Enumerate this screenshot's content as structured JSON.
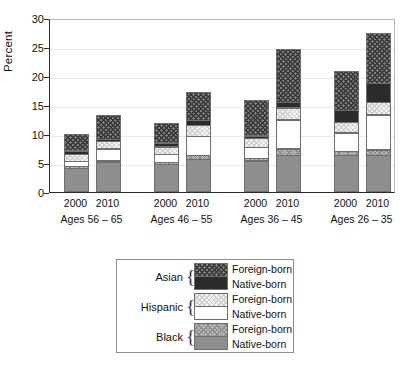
{
  "chart_data": {
    "type": "bar",
    "subtype": "stacked-bar-grouped",
    "title": "",
    "xlabel": "",
    "ylabel": "Percent",
    "ylim": [
      0,
      30
    ],
    "yticks": [
      0,
      5,
      10,
      15,
      20,
      25,
      30
    ],
    "ytick_labels": [
      "0",
      "5",
      "10",
      "15",
      "20",
      "25",
      "30"
    ],
    "grid": true,
    "legend_position": "below-plot",
    "categories": [
      "Ages 56 – 65 / 2000",
      "Ages 56 – 65 / 2010",
      "Ages 46 – 55 / 2000",
      "Ages 46 – 55 / 2010",
      "Ages 36 – 45 / 2000",
      "Ages 36 – 45 / 2010",
      "Ages 26 – 35 / 2000",
      "Ages 26 – 35 / 2010"
    ],
    "groups": [
      {
        "label": "Ages 56 – 65",
        "years": [
          "2000",
          "2010"
        ]
      },
      {
        "label": "Ages 46 – 55",
        "years": [
          "2000",
          "2010"
        ]
      },
      {
        "label": "Ages 36 – 45",
        "years": [
          "2000",
          "2010"
        ]
      },
      {
        "label": "Ages 26 – 35",
        "years": [
          "2000",
          "2010"
        ]
      }
    ],
    "series": [
      {
        "name": "Black Native-born",
        "key": "black_native",
        "values": [
          4.1,
          5.1,
          4.8,
          5.7,
          5.4,
          6.4,
          6.3,
          6.4
        ]
      },
      {
        "name": "Black Foreign-born",
        "key": "black_foreign",
        "values": [
          0.5,
          0.4,
          0.5,
          0.8,
          0.6,
          1.2,
          0.9,
          1.0
        ]
      },
      {
        "name": "Hispanic Native-born",
        "key": "hispanic_native",
        "values": [
          1.0,
          2.2,
          1.5,
          3.4,
          2.0,
          5.1,
          3.3,
          6.2
        ]
      },
      {
        "name": "Hispanic Foreign-born",
        "key": "hispanic_foreign",
        "values": [
          1.3,
          1.4,
          1.4,
          2.0,
          1.6,
          2.2,
          1.9,
          2.3
        ]
      },
      {
        "name": "Asian Native-born",
        "key": "asian_native",
        "values": [
          0.7,
          0.5,
          0.8,
          1.0,
          0.6,
          1.1,
          2.2,
          3.4
        ]
      },
      {
        "name": "Asian Foreign-born",
        "key": "asian_foreign",
        "values": [
          3.0,
          4.2,
          3.5,
          4.9,
          6.3,
          9.3,
          6.9,
          8.8
        ]
      }
    ],
    "totals": [
      10.6,
      13.8,
      12.5,
      17.8,
      16.5,
      25.3,
      21.5,
      28.1
    ]
  },
  "axes": {
    "ylabel": "Percent",
    "ytick_labels": [
      "0",
      "5",
      "10",
      "15",
      "20",
      "25",
      "30"
    ]
  },
  "legend": {
    "groups": [
      {
        "name": "Asian",
        "foreign_label": "Foreign-born",
        "native_label": "Native-born",
        "foreign_class": "fill-asian-foreign",
        "native_class": "fill-asian-native"
      },
      {
        "name": "Hispanic",
        "foreign_label": "Foreign-born",
        "native_label": "Native-born",
        "foreign_class": "fill-hisp-foreign",
        "native_class": "fill-hisp-native"
      },
      {
        "name": "Black",
        "foreign_label": "Foreign-born",
        "native_label": "Native-born",
        "foreign_class": "fill-black-foreign",
        "native_class": "fill-black-native"
      }
    ],
    "brace": "{"
  },
  "colors": {
    "axis": "#2b2b2b",
    "grid": "#e9e9e9",
    "black_native": "#8e8e8e",
    "hispanic_native": "#ffffff",
    "asian_native": "#2b2b2b",
    "segment_outline": "#6e6e6e"
  }
}
